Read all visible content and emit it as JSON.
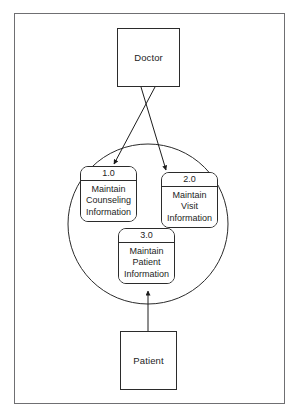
{
  "diagram": {
    "type": "data-flow-diagram",
    "frame": {
      "border_color": "#6f6f72",
      "background": "#ffffff"
    },
    "stroke_color": "#2b2b2b",
    "system_boundary": {
      "shape": "circle",
      "cx": 148,
      "cy": 224,
      "r": 80,
      "label": ""
    },
    "entities": [
      {
        "id": "doctor",
        "label": "Doctor",
        "shape": "rectangle",
        "x": 117,
        "y": 28,
        "w": 63,
        "h": 59
      },
      {
        "id": "patient",
        "label": "Patient",
        "shape": "rectangle",
        "x": 120,
        "y": 331,
        "w": 57,
        "h": 59
      }
    ],
    "processes": [
      {
        "id": "p1",
        "number": "1.0",
        "lines": [
          "Maintain",
          "Counseling",
          "Information"
        ],
        "x": 80,
        "y": 166,
        "w": 57,
        "h": 56
      },
      {
        "id": "p2",
        "number": "2.0",
        "lines": [
          "Maintain",
          "Visit",
          "Information"
        ],
        "x": 161,
        "y": 172,
        "w": 57,
        "h": 56
      },
      {
        "id": "p3",
        "number": "3.0",
        "lines": [
          "Maintain",
          "Patient",
          "Information"
        ],
        "x": 118,
        "y": 228,
        "w": 57,
        "h": 56
      }
    ],
    "flows": [
      {
        "id": "flow-doctor-to-p1",
        "from": "doctor",
        "to": "p1",
        "label": "",
        "points": [
          [
            155,
            87
          ],
          [
            114,
            164
          ]
        ],
        "arrowhead": "end"
      },
      {
        "id": "flow-doctor-to-p2",
        "from": "doctor",
        "to": "p2",
        "label": "",
        "points": [
          [
            141,
            87
          ],
          [
            166,
            170
          ]
        ],
        "arrowhead": "end"
      },
      {
        "id": "flow-patient-to-p3",
        "from": "patient",
        "to": "p3",
        "label": "",
        "points": [
          [
            148,
            331
          ],
          [
            148,
            291
          ]
        ],
        "arrowhead": "end"
      }
    ]
  }
}
